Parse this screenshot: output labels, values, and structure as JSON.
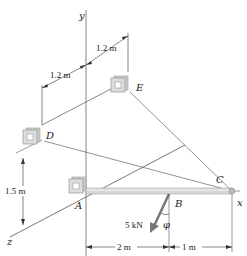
{
  "figure": {
    "axes": {
      "y": "y",
      "x": "x",
      "z": "z"
    },
    "points": {
      "A": "A",
      "B": "B",
      "C": "C",
      "D": "D",
      "E": "E"
    },
    "dimensions": {
      "dim_1": "1.2 m",
      "dim_2": "1.2 m",
      "dim_3": "1.5 m",
      "dim_4": "2 m",
      "dim_5": "1 m"
    },
    "force": {
      "label": "5 kN",
      "angle": "φ"
    }
  }
}
